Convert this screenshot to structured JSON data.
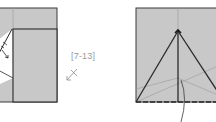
{
  "diagram": {
    "type": "origami-folding-instructions",
    "step_reference": "[7-13]",
    "colors": {
      "paper": "#c8c8c8",
      "paper_back": "#ffffff",
      "line": "#2a2a2a",
      "crease": "#9a9a9a",
      "label": "#9a9a9a"
    },
    "panels": [
      {
        "name": "left-step",
        "description": "Folded square with inner flap and white triangular pocket, arrows indicating fold"
      },
      {
        "name": "right-step",
        "description": "Square with triangular fold lines, vertical center crease, dashed bottom valley fold and curved leader line"
      }
    ]
  }
}
